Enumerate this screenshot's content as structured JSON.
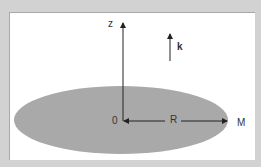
{
  "diagram": {
    "labels": {
      "z_axis": "z",
      "unit_vector": "k",
      "origin": "0",
      "radius": "R",
      "point": "M"
    },
    "colors": {
      "background": "#d2d2d2",
      "panel": "#ffffff",
      "disk": "#a9a9a9",
      "lines": "#222222"
    }
  }
}
